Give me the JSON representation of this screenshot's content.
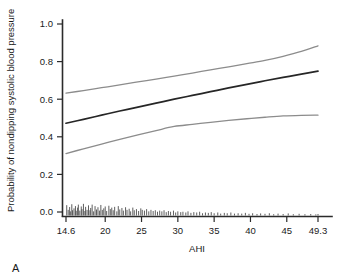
{
  "panel": {
    "label": "A"
  },
  "chart_data": {
    "type": "line",
    "title": "",
    "xlabel": "AHI",
    "ylabel": "Probability of nondipping systolic blood pressure",
    "xlim": [
      14.6,
      49.3
    ],
    "ylim": [
      0.0,
      1.0
    ],
    "grid": false,
    "legend": null,
    "xticks": [
      14.6,
      20,
      25,
      30,
      35,
      40,
      45,
      49.3
    ],
    "xticklabels": [
      "14.6",
      "20",
      "25",
      "30",
      "35",
      "40",
      "45",
      "49.3"
    ],
    "yticks": [
      0.0,
      0.2,
      0.4,
      0.6,
      0.8,
      1.0
    ],
    "yticklabels": [
      "0.0",
      "0.2",
      "0.4",
      "0.6",
      "0.8",
      "1.0"
    ],
    "colors": {
      "fit": "#262626",
      "ci": "#8c8c8c",
      "axis": "#2b2b2b",
      "rug": "#4d4d4d"
    },
    "x": [
      14.6,
      17.0,
      19.5,
      22.0,
      24.5,
      27.0,
      29.5,
      32.0,
      34.5,
      37.0,
      39.5,
      42.0,
      44.5,
      47.0,
      49.3
    ],
    "series": [
      {
        "name": "Upper 95% confidence limit",
        "style": "ci-upper",
        "values": [
          0.632,
          0.646,
          0.661,
          0.676,
          0.692,
          0.707,
          0.723,
          0.739,
          0.756,
          0.772,
          0.789,
          0.806,
          0.828,
          0.854,
          0.884
        ]
      },
      {
        "name": "Predicted probability",
        "style": "fit",
        "values": [
          0.472,
          0.493,
          0.515,
          0.537,
          0.558,
          0.579,
          0.6,
          0.62,
          0.64,
          0.66,
          0.679,
          0.698,
          0.716,
          0.733,
          0.749
        ]
      },
      {
        "name": "Lower 95% confidence limit",
        "style": "ci-lower",
        "values": [
          0.311,
          0.336,
          0.361,
          0.386,
          0.41,
          0.433,
          0.455,
          0.466,
          0.477,
          0.487,
          0.496,
          0.504,
          0.511,
          0.514,
          0.515
        ]
      }
    ],
    "rug": {
      "description": "Observed AHI values marked as vertical ticks along the x-axis baseline",
      "values": [
        14.7,
        14.9,
        15.1,
        15.2,
        15.4,
        15.5,
        15.7,
        15.9,
        16.0,
        16.2,
        16.3,
        16.5,
        16.7,
        16.8,
        17.0,
        17.2,
        17.3,
        17.5,
        17.7,
        17.9,
        18.0,
        18.2,
        18.4,
        18.6,
        18.8,
        19.0,
        19.2,
        19.4,
        19.6,
        19.8,
        20.0,
        20.2,
        20.5,
        20.7,
        20.9,
        21.1,
        21.3,
        21.6,
        21.8,
        22.0,
        22.3,
        22.5,
        22.8,
        23.0,
        23.3,
        23.5,
        23.8,
        24.0,
        24.3,
        24.6,
        24.9,
        25.1,
        25.4,
        25.7,
        26.0,
        26.3,
        26.6,
        26.9,
        27.2,
        27.5,
        27.8,
        28.1,
        28.4,
        28.7,
        29.0,
        29.4,
        29.7,
        30.0,
        30.4,
        30.7,
        31.1,
        31.4,
        31.8,
        32.2,
        32.6,
        33.0,
        33.4,
        33.8,
        34.2,
        34.6,
        35.0,
        35.5,
        35.9,
        36.4,
        36.8,
        37.3,
        37.8,
        38.3,
        38.8,
        39.3,
        39.8,
        40.3,
        40.9,
        41.4,
        42.0,
        42.6,
        43.2,
        43.8,
        44.5,
        45.2,
        45.9,
        46.7,
        47.5,
        48.3,
        49.0,
        49.3
      ],
      "heights": [
        0.055,
        0.03,
        0.045,
        0.022,
        0.06,
        0.028,
        0.038,
        0.05,
        0.025,
        0.042,
        0.058,
        0.026,
        0.048,
        0.034,
        0.062,
        0.024,
        0.046,
        0.03,
        0.054,
        0.028,
        0.04,
        0.058,
        0.022,
        0.05,
        0.032,
        0.044,
        0.026,
        0.056,
        0.03,
        0.038,
        0.048,
        0.024,
        0.052,
        0.034,
        0.042,
        0.028,
        0.046,
        0.022,
        0.05,
        0.032,
        0.04,
        0.026,
        0.044,
        0.03,
        0.036,
        0.022,
        0.042,
        0.028,
        0.034,
        0.024,
        0.038,
        0.03,
        0.026,
        0.034,
        0.022,
        0.03,
        0.024,
        0.028,
        0.02,
        0.026,
        0.022,
        0.028,
        0.018,
        0.024,
        0.02,
        0.026,
        0.016,
        0.022,
        0.018,
        0.02,
        0.016,
        0.022,
        0.014,
        0.018,
        0.016,
        0.02,
        0.012,
        0.016,
        0.014,
        0.018,
        0.012,
        0.016,
        0.01,
        0.014,
        0.012,
        0.016,
        0.01,
        0.012,
        0.01,
        0.014,
        0.009,
        0.012,
        0.008,
        0.011,
        0.009,
        0.012,
        0.007,
        0.01,
        0.008,
        0.011,
        0.007,
        0.009,
        0.007,
        0.008,
        0.006,
        0.008
      ]
    }
  }
}
